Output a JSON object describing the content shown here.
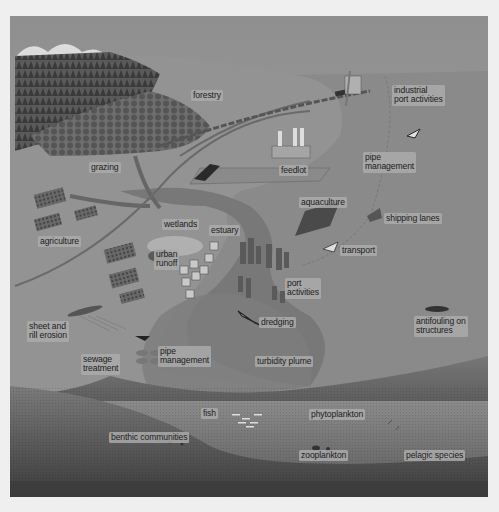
{
  "diagram": {
    "colors": {
      "page_background": "#efefef",
      "sky": "#9a9a9a",
      "land": "#8e8e8e",
      "sea_surface": "#8a8a8a",
      "estuary_water": "#747474",
      "turbidity_plume": "#9a9a9a",
      "deep_water": "#6e6e6e",
      "seabed": "#4a4a4a",
      "forest": "#474747",
      "label_bg": "#aaaaaa",
      "label_text": "#1d1d1d"
    },
    "land_labels": {
      "forestry": "forestry",
      "grazing": "grazing",
      "feedlot": "feedlot",
      "agriculture": "agriculture",
      "wetlands": "wetlands",
      "estuary": "estuary",
      "urban_runoff": "urban\nrunoff",
      "sheet_rill_erosion": "sheet and\nrill erosion",
      "sewage_treatment": "sewage\ntreatment",
      "pipe_management_land": "pipe\nmanagement"
    },
    "coastal_labels": {
      "industrial_port": "industrial\nport activities",
      "pipe_management_coast": "pipe\nmanagement",
      "aquaculture": "aquaculture",
      "shipping_lanes": "shipping lanes",
      "transport": "transport",
      "port_activities": "port\nactivities",
      "dredging": "dredging",
      "antifouling": "antifouling on\nstructures",
      "turbidity_plume": "turbidity plume"
    },
    "marine_labels": {
      "fish": "fish",
      "phytoplankton": "phytoplankton",
      "benthic": "benthic communities",
      "zooplankton": "zooplankton",
      "pelagic": "pelagic species"
    }
  }
}
